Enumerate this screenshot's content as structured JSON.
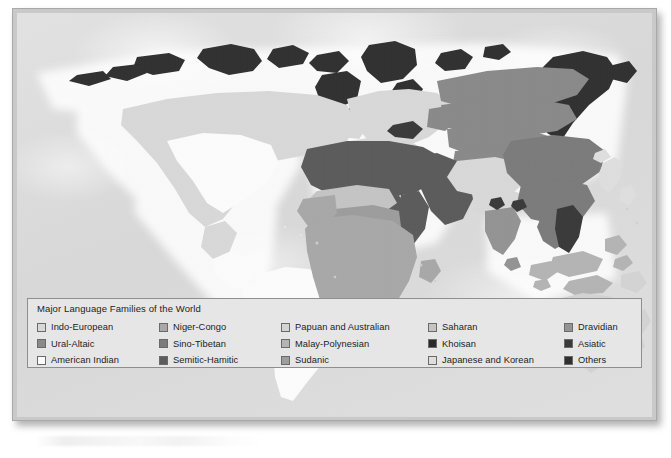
{
  "figure": {
    "kind": "thematic-world-map",
    "legend": {
      "title": "Major Language Families of the World",
      "columns": [
        {
          "items": [
            {
              "label": "Indo-European",
              "color": "#d8d8d8"
            },
            {
              "label": "Ural-Altaic",
              "color": "#8a8a8a"
            },
            {
              "label": "American Indian",
              "color": "#fbfbfb"
            }
          ]
        },
        {
          "items": [
            {
              "label": "Niger-Congo",
              "color": "#a8a8a8"
            },
            {
              "label": "Sino-Tibetan",
              "color": "#7b7b7b"
            },
            {
              "label": "Semitic-Hamitic",
              "color": "#5c5c5c"
            }
          ]
        },
        {
          "items": [
            {
              "label": "Papuan and Australian",
              "color": "#d3d3d3"
            },
            {
              "label": "Malay-Polynesian",
              "color": "#b4b4b4"
            },
            {
              "label": "Sudanic",
              "color": "#9d9d9d"
            }
          ]
        },
        {
          "items": [
            {
              "label": "Saharan",
              "color": "#c4c4c4"
            },
            {
              "label": "Khoisan",
              "color": "#2a2a2a"
            },
            {
              "label": "Japanese and Korean",
              "color": "#dedede"
            }
          ]
        },
        {
          "items": [
            {
              "label": "Dravidian",
              "color": "#949494"
            },
            {
              "label": "Asiatic",
              "color": "#3a3a3a"
            },
            {
              "label": "Others",
              "color": "#303030"
            }
          ]
        }
      ]
    },
    "palette": {
      "ocean": "#dcdcdc",
      "plate_border": "#a8a8a8",
      "legend_background": "#e6e6e6",
      "legend_border": "#8e8e8e",
      "page_background": "#ffffff"
    },
    "regions": [
      {
        "name": "north-america-canada-us",
        "family": "Indo-European"
      },
      {
        "name": "north-america-interior",
        "family": "American Indian"
      },
      {
        "name": "south-america",
        "family": "American Indian"
      },
      {
        "name": "greenland-arctic",
        "family": "Others"
      },
      {
        "name": "europe",
        "family": "Indo-European"
      },
      {
        "name": "russia-siberia",
        "family": "Ural-Altaic"
      },
      {
        "name": "north-africa-arabia",
        "family": "Semitic-Hamitic"
      },
      {
        "name": "sahel",
        "family": "Saharan"
      },
      {
        "name": "sub-saharan-africa",
        "family": "Niger-Congo"
      },
      {
        "name": "southern-africa-pocket",
        "family": "Khoisan"
      },
      {
        "name": "central-sudan",
        "family": "Sudanic"
      },
      {
        "name": "china-southeast-asia",
        "family": "Sino-Tibetan"
      },
      {
        "name": "indochina-pocket",
        "family": "Asiatic"
      },
      {
        "name": "northern-india",
        "family": "Indo-European"
      },
      {
        "name": "southern-india",
        "family": "Dravidian"
      },
      {
        "name": "indonesia-philippines",
        "family": "Malay-Polynesian"
      },
      {
        "name": "australia-new-guinea",
        "family": "Papuan and Australian"
      },
      {
        "name": "japan-korea",
        "family": "Japanese and Korean"
      },
      {
        "name": "far-east-siberia",
        "family": "Others"
      }
    ]
  }
}
